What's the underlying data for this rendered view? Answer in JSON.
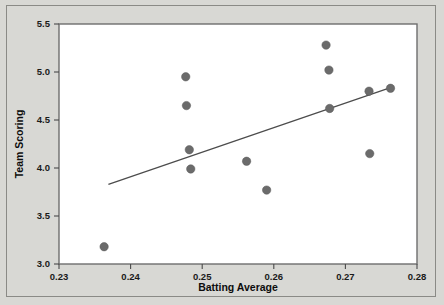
{
  "chart_data": {
    "type": "scatter",
    "title": "",
    "xlabel": "Batting Average",
    "ylabel": "Team Scoring",
    "xlim": [
      0.23,
      0.28
    ],
    "ylim": [
      3.0,
      5.5
    ],
    "grid": false,
    "legend": "none",
    "xticks": [
      "0.23",
      "0.24",
      "0.25",
      "0.26",
      "0.27",
      "0.28"
    ],
    "xtick_values": [
      0.23,
      0.24,
      0.25,
      0.26,
      0.27,
      0.28
    ],
    "yticks": [
      "3.0",
      "3.5",
      "4.0",
      "4.5",
      "5.0",
      "5.5"
    ],
    "ytick_values": [
      3.0,
      3.5,
      4.0,
      4.5,
      5.0,
      5.5
    ],
    "marker": {
      "shape": "circle",
      "color": "#6b6b6b",
      "size": 4.2
    },
    "points": [
      {
        "x": 0.2363,
        "y": 3.18
      },
      {
        "x": 0.2477,
        "y": 4.95
      },
      {
        "x": 0.2478,
        "y": 4.65
      },
      {
        "x": 0.2482,
        "y": 4.19
      },
      {
        "x": 0.2484,
        "y": 3.99
      },
      {
        "x": 0.2562,
        "y": 4.07
      },
      {
        "x": 0.259,
        "y": 3.77
      },
      {
        "x": 0.2673,
        "y": 5.28
      },
      {
        "x": 0.2677,
        "y": 5.02
      },
      {
        "x": 0.2678,
        "y": 4.62
      },
      {
        "x": 0.2734,
        "y": 4.15
      },
      {
        "x": 0.2733,
        "y": 4.8
      },
      {
        "x": 0.2763,
        "y": 4.83
      }
    ],
    "fit_line": {
      "type": "linear-regression",
      "color": "#4c4c4c",
      "x_start": 0.2369,
      "y_start": 3.83,
      "x_end": 0.2764,
      "y_end": 4.84
    }
  },
  "figure": {
    "background_color": "#d8d8d4",
    "panel_color": "#ffffff",
    "frame_color": "#8a8a86"
  }
}
